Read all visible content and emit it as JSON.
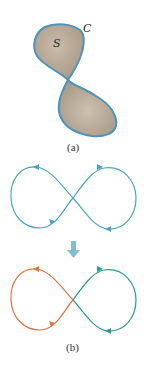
{
  "figure_a": {
    "surface_label": "S",
    "curve_label": "C",
    "caption": "(a)",
    "fill_color": "#b5a693",
    "edge_color": "#4a93bd"
  },
  "figure_b": {
    "caption": "(b)",
    "top_curve_color": "#4aa3c8",
    "arrow_color": "#7fbfd4",
    "left_loop_color": "#e0733a",
    "right_loop_color": "#2c9a9a"
  }
}
